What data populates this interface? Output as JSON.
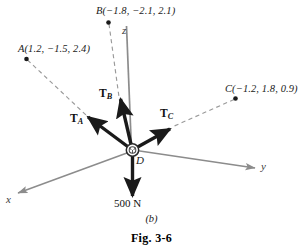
{
  "figure": {
    "panel_letter": "(b)",
    "caption": "Fig. 3-6",
    "width": 303,
    "height": 252,
    "background": "#ffffff"
  },
  "colors": {
    "axis": "#8c8c8c",
    "dashed_guide": "#9a9a9a",
    "vector": "#1a1a1a",
    "text": "#1a1a1a",
    "node_fill": "#ffffff",
    "node_stroke": "#2a2a2a"
  },
  "axes": [
    {
      "name": "z",
      "label": "z",
      "direction": "up"
    },
    {
      "name": "y",
      "label": "y",
      "direction": "lower-right"
    },
    {
      "name": "x",
      "label": "x",
      "direction": "lower-left"
    }
  ],
  "node": {
    "label": "D",
    "description": "ring-joint"
  },
  "points": [
    {
      "name": "A",
      "label": "A(1.2, −1.5, 2.4)",
      "coords": [
        1.2,
        -1.5,
        2.4
      ]
    },
    {
      "name": "B",
      "label": "B(−1.8, −2.1, 2.1)",
      "coords": [
        -1.8,
        -2.1,
        2.1
      ]
    },
    {
      "name": "C",
      "label": "C(−1.2, 1.8, 0.9)",
      "coords": [
        -1.2,
        1.8,
        0.9
      ]
    }
  ],
  "vectors": [
    {
      "name": "T_A",
      "symbol": "T",
      "subscript": "A",
      "toward": "A"
    },
    {
      "name": "T_B",
      "symbol": "T",
      "subscript": "B",
      "toward": "B"
    },
    {
      "name": "T_C",
      "symbol": "T",
      "subscript": "C",
      "toward": "C"
    }
  ],
  "load": {
    "label": "500 N",
    "magnitude": 500,
    "unit": "N",
    "direction": "down"
  }
}
